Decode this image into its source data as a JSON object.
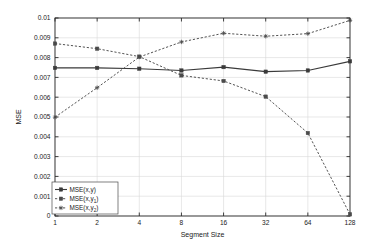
{
  "chart_data": {
    "type": "line",
    "title": "",
    "xlabel": "Segment Size",
    "ylabel": "MSE",
    "x": [
      1,
      2,
      4,
      8,
      16,
      32,
      64,
      128
    ],
    "xtick_labels": [
      "1",
      "2",
      "4",
      "8",
      "16",
      "32",
      "64",
      "128"
    ],
    "xscale": "log2",
    "ytick_labels": [
      "0",
      "0.001",
      "0.002",
      "0.003",
      "0.004",
      "0.005",
      "0.006",
      "0.007",
      "0.008",
      "0.009",
      "0.01"
    ],
    "ytick_values": [
      0,
      0.001,
      0.002,
      0.003,
      0.004,
      0.005,
      0.006,
      0.007,
      0.008,
      0.009,
      0.01
    ],
    "ylim": [
      0,
      0.01
    ],
    "grid": true,
    "legend_position": "lower-left",
    "series": [
      {
        "name": "MSE(x,y)",
        "label_base": "MSE(x,y)",
        "label_subscript": "",
        "style": "solid",
        "marker": "square",
        "color": "#3a3a3a",
        "values": [
          0.00748,
          0.00748,
          0.00744,
          0.00735,
          0.00752,
          0.00729,
          0.00735,
          0.00781
        ]
      },
      {
        "name": "MSE(x,y1)",
        "label_base": "MSE(x,y",
        "label_subscript": "1",
        "style": "dashed",
        "marker": "square",
        "color": "#4a4a4a",
        "values": [
          0.00871,
          0.00845,
          0.00805,
          0.0071,
          0.00682,
          0.00603,
          0.00419,
          8e-05
        ]
      },
      {
        "name": "MSE(x,y2)",
        "label_base": "MSE(x,y",
        "label_subscript": "2",
        "style": "dashed",
        "marker": "star",
        "color": "#4a4a4a",
        "values": [
          0.00499,
          0.00648,
          0.00803,
          0.00879,
          0.00923,
          0.00908,
          0.00921,
          0.00988
        ]
      }
    ]
  }
}
